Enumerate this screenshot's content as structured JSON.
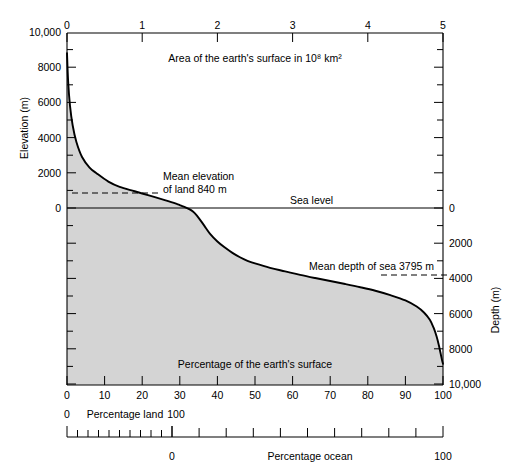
{
  "figure": {
    "title_top_axis": "Area of the earth's surface in 10⁸ km²",
    "inside_label": "Percentage of the earth's surface",
    "sea_level_label": "Sea level",
    "mean_elevation_label_line1": "Mean elevation",
    "mean_elevation_label_line2": "of land 840 m",
    "mean_depth_label": "Mean depth of sea 3795 m",
    "left_axis_title": "Elevation (m)",
    "right_axis_title": "Depth (m)",
    "bottom_axis_land_left": "0",
    "bottom_axis_land_title": "Percentage land",
    "bottom_axis_land_right": "100",
    "ocean_axis_zero": "0",
    "ocean_axis_title": "Percentage ocean",
    "ocean_axis_hundred": "100"
  },
  "chart_data": {
    "type": "area",
    "xlabel": "Percentage of the earth's surface",
    "ylabel": "Elevation (m)",
    "xlim": [
      0,
      100
    ],
    "ylim": [
      -10000,
      10000
    ],
    "grid": false,
    "legend": "none",
    "fill_color": "#d4d4d4",
    "line_color": "#000000",
    "series": [
      {
        "name": "Hypsographic curve",
        "x": [
          0.0,
          0.3,
          0.8,
          1.5,
          2.5,
          4.0,
          6.0,
          8.0,
          11.0,
          14.0,
          18.0,
          22.0,
          26.0,
          29.0,
          29.5,
          30.5,
          31.5,
          32.5,
          33.5,
          34.5,
          35.5,
          36.5,
          38.0,
          40.0,
          42.0,
          44.0,
          46.0,
          48.0,
          50.0,
          54.0,
          58.0,
          62.0,
          66.0,
          70.0,
          74.0,
          78.0,
          82.0,
          86.0,
          90.0,
          93.0,
          95.0,
          96.5,
          97.5,
          98.3,
          98.9,
          99.3,
          99.6,
          99.8,
          100.0
        ],
        "y": [
          8800,
          7200,
          5800,
          4700,
          3750,
          2900,
          2300,
          1950,
          1500,
          1200,
          950,
          700,
          450,
          250,
          200,
          120,
          40,
          -60,
          -200,
          -420,
          -700,
          -1000,
          -1450,
          -1900,
          -2250,
          -2550,
          -2800,
          -3000,
          -3150,
          -3400,
          -3600,
          -3800,
          -3980,
          -4150,
          -4320,
          -4500,
          -4700,
          -4950,
          -5250,
          -5600,
          -5950,
          -6350,
          -6800,
          -7300,
          -7800,
          -8200,
          -8500,
          -8700,
          -8850
        ]
      }
    ],
    "annotations": [
      {
        "label": "Mean elevation of land 840 m",
        "value": 840,
        "unit": "m",
        "type": "dashed-reference-line"
      },
      {
        "label": "Mean depth of sea 3795 m",
        "value": -3795,
        "unit": "m",
        "type": "dashed-reference-line"
      },
      {
        "label": "Sea level",
        "value": 0,
        "unit": "m",
        "type": "reference-line"
      }
    ],
    "axes": {
      "top": {
        "label": "Area of the earth's surface in 10⁸ km²",
        "ticks": [
          0,
          1,
          2,
          3,
          4,
          5
        ],
        "tick_labels": [
          "0",
          "1",
          "2",
          "3",
          "4",
          "5"
        ],
        "unit": "10^8 km^2"
      },
      "left": {
        "label": "Elevation (m)",
        "ticks": [
          10000,
          8000,
          6000,
          4000,
          2000,
          0
        ],
        "tick_labels": [
          "10,000",
          "8000",
          "6000",
          "4000",
          "2000",
          "0"
        ],
        "minor_step": 1000
      },
      "right": {
        "label": "Depth (m)",
        "ticks": [
          0,
          2000,
          4000,
          6000,
          8000,
          10000
        ],
        "tick_labels": [
          "0",
          "2000",
          "4000",
          "6000",
          "8000",
          "10,000"
        ],
        "minor_step": 1000
      },
      "bottom_primary": {
        "label": "Percentage of the earth's surface",
        "ticks": [
          0,
          10,
          20,
          30,
          40,
          50,
          60,
          70,
          80,
          90,
          100
        ],
        "tick_labels": [
          "0",
          "10",
          "20",
          "30",
          "40",
          "50",
          "60",
          "70",
          "80",
          "90",
          "100"
        ]
      },
      "bottom_land": {
        "label": "Percentage land",
        "tick_labels": [
          "0",
          "100"
        ],
        "zero_at_percent": 0,
        "hundred_at_percent": 29
      },
      "bottom_ocean": {
        "label": "Percentage ocean",
        "tick_labels": [
          "0",
          "100"
        ],
        "zero_at_percent": 29,
        "hundred_at_percent": 100
      }
    }
  }
}
